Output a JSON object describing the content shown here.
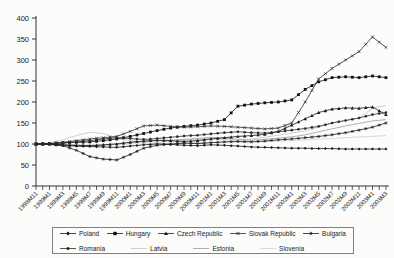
{
  "chart_data": {
    "type": "line",
    "title": "",
    "xlabel": "",
    "ylabel": "",
    "ylim": [
      0,
      400
    ],
    "y_ticks": [
      0,
      50,
      100,
      150,
      200,
      250,
      300,
      350,
      400
    ],
    "grid": false,
    "legend_position": "bottom-box",
    "x_tick_labels": [
      "1998M11",
      "1999M1",
      "1999M3",
      "1999M5",
      "1999M7",
      "1999M9",
      "1999M11",
      "2000M1",
      "2000M3",
      "2000M5",
      "2000M7",
      "2000M9",
      "2000M11",
      "2001M1",
      "2001M3",
      "2001M5",
      "2001M7",
      "2001M9",
      "2001M11",
      "2002M1",
      "2002M3",
      "2002M5",
      "2002M7",
      "2002M9",
      "2002M11",
      "2003M1",
      "2003M3"
    ],
    "series": [
      {
        "name": "Poland",
        "marker": "diamond",
        "color": "#1a1a1a",
        "values": [
          100,
          100,
          97,
          95,
          94,
          93,
          92,
          95,
          98,
          100,
          99,
          97,
          96,
          98,
          97,
          95,
          93,
          92,
          91,
          90,
          90,
          89,
          89,
          88,
          88,
          88,
          88
        ]
      },
      {
        "name": "Hungary",
        "marker": "square",
        "color": "#111111",
        "values": [
          100,
          101,
          103,
          104,
          105,
          108,
          112,
          118,
          125,
          132,
          138,
          142,
          145,
          150,
          158,
          190,
          195,
          198,
          200,
          205,
          230,
          248,
          258,
          260,
          258,
          262,
          258
        ]
      },
      {
        "name": "Czech Republic",
        "marker": "triangle",
        "color": "#1a1a1a",
        "values": [
          100,
          100,
          98,
          97,
          96,
          98,
          100,
          104,
          107,
          109,
          108,
          106,
          108,
          112,
          115,
          118,
          120,
          123,
          130,
          145,
          160,
          175,
          183,
          186,
          185,
          188,
          170
        ]
      },
      {
        "name": "Slovak Republic",
        "marker": "x",
        "color": "#2b2b2b",
        "values": [
          100,
          101,
          104,
          108,
          112,
          115,
          118,
          130,
          143,
          145,
          142,
          140,
          141,
          143,
          142,
          140,
          138,
          136,
          138,
          150,
          200,
          255,
          280,
          300,
          320,
          355,
          330
        ]
      },
      {
        "name": "Bulgaria",
        "marker": "asterisk",
        "color": "#1a1a1a",
        "values": [
          100,
          99,
          96,
          85,
          70,
          64,
          62,
          75,
          90,
          97,
          100,
          102,
          101,
          103,
          105,
          106,
          105,
          107,
          110,
          112,
          115,
          118,
          122,
          127,
          133,
          140,
          150
        ]
      },
      {
        "name": "Romania",
        "marker": "circle",
        "color": "#2b2b2b",
        "values": [
          100,
          100,
          102,
          105,
          108,
          112,
          115,
          113,
          111,
          113,
          116,
          119,
          121,
          124,
          127,
          129,
          127,
          126,
          129,
          133,
          137,
          142,
          150,
          156,
          162,
          170,
          175
        ]
      },
      {
        "name": "Latvia",
        "marker": "none",
        "color": "#c3c3c3",
        "values": [
          100,
          103,
          110,
          120,
          128,
          125,
          113,
          108,
          105,
          104,
          106,
          109,
          111,
          113,
          111,
          109,
          112,
          116,
          121,
          126,
          131,
          140,
          150,
          156,
          162,
          185,
          192
        ]
      },
      {
        "name": "Estonia",
        "marker": "none",
        "color": "#9a9a9a",
        "values": [
          100,
          100,
          98,
          96,
          95,
          97,
          101,
          104,
          106,
          108,
          109,
          111,
          113,
          116,
          114,
          111,
          109,
          111,
          114,
          117,
          122,
          129,
          136,
          143,
          149,
          155,
          158
        ]
      },
      {
        "name": "Slovenia",
        "marker": "none",
        "color": "#cfcfcf",
        "values": [
          100,
          100,
          99,
          98,
          98,
          98,
          99,
          100,
          101,
          101,
          102,
          103,
          103,
          104,
          105,
          105,
          106,
          106,
          107,
          108,
          110,
          112,
          113,
          115,
          117,
          118,
          120
        ]
      }
    ],
    "legend_rows": [
      [
        "Poland",
        "Hungary",
        "Czech Republic",
        "Slovak Republic",
        "Bulgaria"
      ],
      [
        "Romania",
        "Latvia",
        "Estonia",
        "Slovenia"
      ]
    ],
    "axis_color": "#333333"
  }
}
